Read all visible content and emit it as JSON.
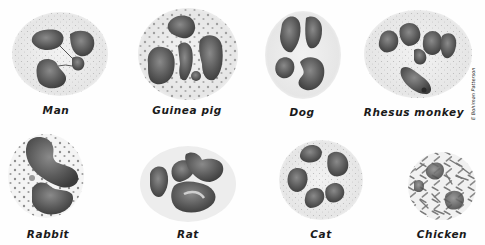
{
  "figure": {
    "signature": "E Bohlman Patterson",
    "colors": {
      "cytoplasm": "#ececec",
      "granule": "#9a9a9a",
      "nucleus_dark": "#4a4a4a",
      "nucleus_mid": "#6f6f6f",
      "nucleus_light": "#b0b0b0",
      "label_text": "#1a1a1a"
    },
    "cells": [
      {
        "label": "Man",
        "row": 1,
        "col": 1
      },
      {
        "label": "Guinea pig",
        "row": 1,
        "col": 2
      },
      {
        "label": "Dog",
        "row": 1,
        "col": 3
      },
      {
        "label": "Rhesus monkey",
        "row": 1,
        "col": 4
      },
      {
        "label": "Rabbit",
        "row": 2,
        "col": 1
      },
      {
        "label": "Rat",
        "row": 2,
        "col": 2
      },
      {
        "label": "Cat",
        "row": 2,
        "col": 3
      },
      {
        "label": "Chicken",
        "row": 2,
        "col": 4
      }
    ]
  }
}
